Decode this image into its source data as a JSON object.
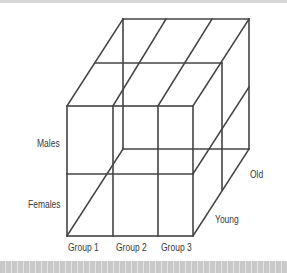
{
  "diagram": {
    "type": "3d-cube-grid",
    "line_color": "#444444",
    "labels": {
      "rows": [
        "Males",
        "Females"
      ],
      "columns": [
        "Group 1",
        "Group 2",
        "Group 3"
      ],
      "depth": [
        "Young",
        "Old"
      ]
    }
  }
}
